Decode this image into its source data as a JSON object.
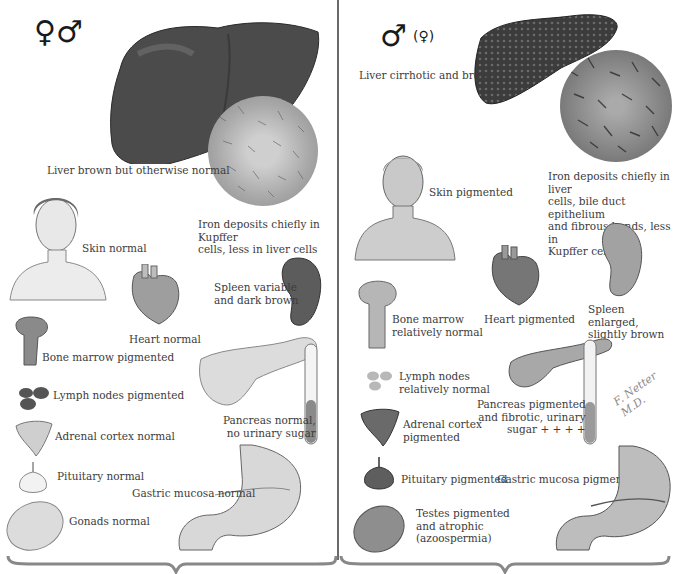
{
  "left_panel": {
    "symbol": "♀♂",
    "labels": {
      "liver": "Liver brown but otherwise normal",
      "iron": "Iron deposits chiefly in Kupffer\ncells, less in liver cells",
      "skin": "Skin normal",
      "heart": "Heart normal",
      "spleen": "Spleen variable\nand dark brown",
      "bone_marrow": "Bone marrow pigmented",
      "lymph": "Lymph nodes pigmented",
      "pancreas": "Pancreas normal,\nno urinary sugar",
      "adrenal": "Adrenal cortex normal",
      "pituitary": "Pituitary normal",
      "gastric": "Gastric mucosa normal",
      "gonads": "Gonads normal"
    }
  },
  "right_panel": {
    "symbol": "♂",
    "symbol_secondary": "(♀)",
    "labels": {
      "liver": "Liver cirrhotic and brown",
      "iron": "Iron deposits chiefly in liver\ncells, bile duct epithelium\nand fibrous bands, less in\nKupffer cells",
      "skin": "Skin pigmented",
      "bone_marrow": "Bone marrow\nrelatively normal",
      "heart": "Heart pigmented",
      "spleen": "Spleen enlarged,\nslightly brown",
      "lymph": "Lymph nodes\nrelatively normal",
      "pancreas": "Pancreas pigmented\nand fibrotic, urinary\nsugar + + + +",
      "adrenal": "Adrenal cortex\npigmented",
      "pituitary": "Pituitary pigmented",
      "gastric": "Gastric mucosa pigmented",
      "testes": "Testes pigmented\nand atrophic\n(azoospermia)"
    },
    "signature": "F. Netter M.D."
  },
  "colors": {
    "liver_normal": "#4a4a4a",
    "liver_cirrhotic": "#3a3a3a",
    "tissue_light": "#d8d8d8",
    "tissue_mid": "#9a9a9a",
    "tissue_dark": "#5a5a5a",
    "divider": "#6a6a6a",
    "text": "#3c3c3c"
  }
}
